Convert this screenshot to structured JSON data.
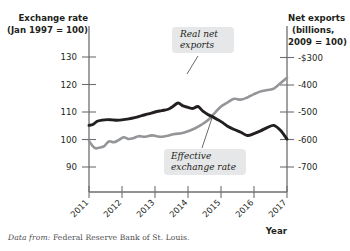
{
  "chart_data": {
    "type": "line",
    "title": "",
    "xlabel": "Year",
    "grid": false,
    "legend_position": "inline-callouts",
    "x": [
      2011,
      2012,
      2013,
      2014,
      2015,
      2016,
      2017
    ],
    "xlim": [
      2011,
      2017
    ],
    "xtick_labels": [
      "2011",
      "2012",
      "2013",
      "2014",
      "2015",
      "2016",
      "2017"
    ],
    "left_axis": {
      "title_line1": "Exchange rate",
      "title_line2": "(Jan 1997 = 100)",
      "tick_labels": [
        "130",
        "120",
        "110",
        "100",
        "90"
      ],
      "ticks": [
        130,
        120,
        110,
        100,
        90
      ],
      "ylim": [
        85,
        135
      ]
    },
    "right_axis": {
      "title_line1": "Net exports",
      "title_line2": "(billions,",
      "title_line3": "2009 = 100)",
      "tick_labels": [
        "-$300",
        "-400",
        "-500",
        "-600",
        "-700"
      ],
      "ticks": [
        -300,
        -400,
        -500,
        -600,
        -700
      ],
      "ylim": [
        -740,
        -260
      ]
    },
    "series": [
      {
        "name": "Real net exports",
        "axis": "right",
        "color": "#231f20",
        "label": "Real net exports",
        "x": [
          2011.0,
          2011.12,
          2011.25,
          2011.4,
          2011.55,
          2011.7,
          2011.85,
          2012.0,
          2012.15,
          2012.3,
          2012.45,
          2012.6,
          2012.8,
          2013.0,
          2013.2,
          2013.4,
          2013.55,
          2013.7,
          2013.85,
          2014.0,
          2014.15,
          2014.3,
          2014.45,
          2014.6,
          2014.75,
          2014.9,
          2015.05,
          2015.2,
          2015.4,
          2015.6,
          2015.8,
          2016.0,
          2016.2,
          2016.4,
          2016.6,
          2016.8,
          2017.0
        ],
        "values": [
          -548,
          -545,
          -533,
          -529,
          -527,
          -528,
          -529,
          -528,
          -525,
          -522,
          -518,
          -512,
          -506,
          -499,
          -494,
          -489,
          -478,
          -466,
          -477,
          -482,
          -486,
          -479,
          -496,
          -508,
          -517,
          -527,
          -538,
          -551,
          -563,
          -573,
          -585,
          -578,
          -568,
          -556,
          -548,
          -566,
          -598
        ]
      },
      {
        "name": "Effective exchange rate",
        "axis": "left",
        "color": "#939598",
        "label": "Effective exchange rate",
        "x": [
          2011.0,
          2011.1,
          2011.2,
          2011.3,
          2011.45,
          2011.6,
          2011.75,
          2011.9,
          2012.05,
          2012.2,
          2012.35,
          2012.5,
          2012.7,
          2012.9,
          2013.05,
          2013.2,
          2013.4,
          2013.6,
          2013.8,
          2014.0,
          2014.2,
          2014.4,
          2014.6,
          2014.8,
          2015.0,
          2015.2,
          2015.4,
          2015.6,
          2015.8,
          2016.0,
          2016.2,
          2016.4,
          2016.6,
          2016.8,
          2017.0
        ],
        "values": [
          99.5,
          97.8,
          96.8,
          97.0,
          97.5,
          99.3,
          99.0,
          99.8,
          100.8,
          100.2,
          100.5,
          101.2,
          101.0,
          101.5,
          101.2,
          101.0,
          101.4,
          102.0,
          102.3,
          103.0,
          104.0,
          105.3,
          107.0,
          109.5,
          112.0,
          113.5,
          114.8,
          114.5,
          115.3,
          116.5,
          117.5,
          118.0,
          118.5,
          120.5,
          122.5
        ]
      }
    ],
    "annotations": [
      {
        "id": "real-net-exports-callout",
        "text_line1": "Real net",
        "text_line2": "exports",
        "target_series": "Real net exports"
      },
      {
        "id": "effective-exchange-rate-callout",
        "text_line1": "Effective",
        "text_line2": "exchange rate",
        "target_series": "Effective exchange rate"
      }
    ]
  },
  "source": {
    "prefix": "Data from:",
    "text": "Federal Reserve Bank of St. Louis."
  },
  "colors": {
    "dark_line": "#231f20",
    "gray_line": "#939598",
    "axis": "#6d6e71",
    "callout_bg": "#e6e7e8",
    "text": "#231f20",
    "source_text": "#4d4d4f"
  }
}
